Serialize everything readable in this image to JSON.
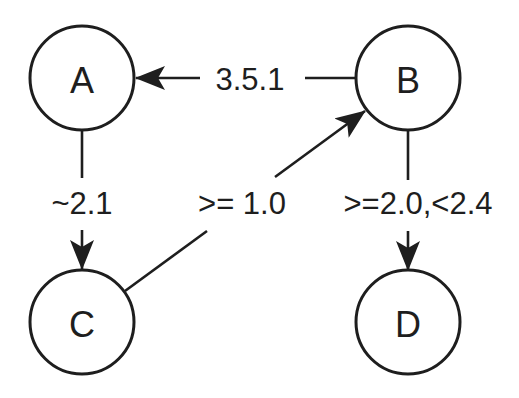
{
  "diagram": {
    "type": "directed-graph",
    "nodes": {
      "A": {
        "label": "A"
      },
      "B": {
        "label": "B"
      },
      "C": {
        "label": "C"
      },
      "D": {
        "label": "D"
      }
    },
    "edges": [
      {
        "from": "B",
        "to": "A",
        "label": "3.5.1"
      },
      {
        "from": "A",
        "to": "C",
        "label": "~2.1"
      },
      {
        "from": "C",
        "to": "B",
        "label": ">= 1.0"
      },
      {
        "from": "B",
        "to": "D",
        "label": ">=2.0,<2.4"
      }
    ],
    "colors": {
      "stroke": "#1e1e1e",
      "background": "#ffffff"
    }
  }
}
